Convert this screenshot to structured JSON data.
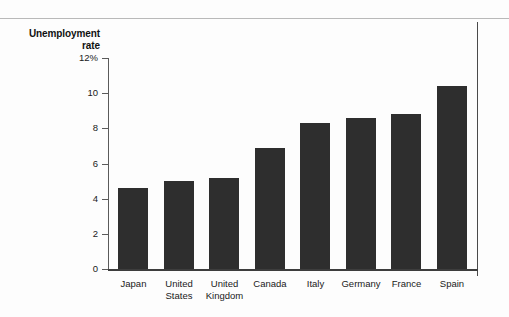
{
  "chart_data": {
    "type": "bar",
    "title": "Unemployment rate",
    "title_lines": [
      "Unemployment",
      "rate"
    ],
    "xlabel": "",
    "ylabel": "Unemployment rate",
    "ylim": [
      0,
      12
    ],
    "grid": false,
    "legend": null,
    "y_ticks": [
      {
        "value": 12,
        "label": "12%"
      },
      {
        "value": 10,
        "label": "10"
      },
      {
        "value": 8,
        "label": "8"
      },
      {
        "value": 6,
        "label": "6"
      },
      {
        "value": 4,
        "label": "4"
      },
      {
        "value": 2,
        "label": "2"
      },
      {
        "value": 0,
        "label": "0"
      }
    ],
    "categories": [
      "Japan",
      "United States",
      "United Kingdom",
      "Canada",
      "Italy",
      "Germany",
      "France",
      "Spain"
    ],
    "category_lines": [
      [
        "Japan"
      ],
      [
        "United",
        "States"
      ],
      [
        "United",
        "Kingdom"
      ],
      [
        "Canada"
      ],
      [
        "Italy"
      ],
      [
        "Germany"
      ],
      [
        "France"
      ],
      [
        "Spain"
      ]
    ],
    "values": [
      4.6,
      5.0,
      5.2,
      6.9,
      8.3,
      8.6,
      8.8,
      10.4
    ],
    "bar_color": "#2e2e2e",
    "axis_color": "#3d3d3d",
    "background": "#fdfdfd"
  }
}
